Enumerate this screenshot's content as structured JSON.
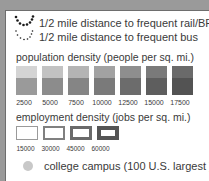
{
  "legend": {
    "transit": [
      {
        "icon": "dotted-arc-rail-icon",
        "label": "1/2 mile distance to frequent rail/BRT"
      },
      {
        "icon": "dotted-arc-bus-icon",
        "label": "1/2 mile distance to frequent bus"
      }
    ],
    "population": {
      "title": "population density (people per sq. mi.)",
      "items": [
        {
          "label": "2500",
          "top": "#d4d4d4",
          "bottom": "#9a9a9a"
        },
        {
          "label": "5000",
          "top": "#c2c2c2",
          "bottom": "#8c8c8c"
        },
        {
          "label": "7500",
          "top": "#b4b4b4",
          "bottom": "#858585"
        },
        {
          "label": "10000",
          "top": "#a2a2a2",
          "bottom": "#7a7a7a"
        },
        {
          "label": "12500",
          "top": "#8e8e8e",
          "bottom": "#6c6c6c"
        },
        {
          "label": "15000",
          "top": "#7a7a7a",
          "bottom": "#5e5e5e"
        },
        {
          "label": "17500",
          "top": "#6a6a6a",
          "bottom": "#535353"
        }
      ]
    },
    "employment": {
      "title": "employment density (jobs per sq. mi.)",
      "items": [
        {
          "label": "15000",
          "border": "1px solid #9a9a9a"
        },
        {
          "label": "30000",
          "border": "2px solid #808080"
        },
        {
          "label": "45000",
          "border": "3px solid #6a6a6a"
        },
        {
          "label": "60000",
          "border": "4px solid #555555"
        }
      ]
    },
    "campus": {
      "icon": "college-campus-dot-icon",
      "label": "college campus (100 U.S. largest )",
      "color": "#c8c8c8"
    }
  }
}
